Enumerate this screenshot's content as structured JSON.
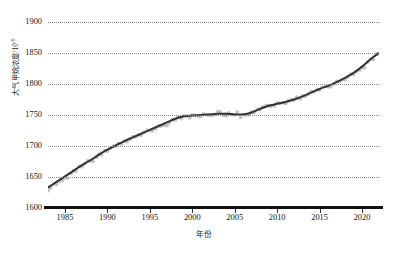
{
  "chart_data": {
    "type": "line",
    "title": "",
    "xlabel": "年份",
    "ylabel": "大气甲烷浓度/10",
    "ylabel_exponent": "-9",
    "xlim": [
      1983,
      2022
    ],
    "ylim": [
      1600,
      1900
    ],
    "yticks": [
      1600,
      1650,
      1700,
      1750,
      1800,
      1850,
      1900
    ],
    "xticks": [
      1985,
      1990,
      1995,
      2000,
      2005,
      2010,
      2015,
      2020
    ],
    "grid": true,
    "legend": "none",
    "series": [
      {
        "name": "大气甲烷浓度观测值",
        "style": "scatter",
        "color": "#b9b9b9",
        "x": [
          1983,
          1984,
          1985,
          1986,
          1987,
          1988,
          1989,
          1990,
          1991,
          1992,
          1993,
          1994,
          1995,
          1996,
          1997,
          1998,
          1999,
          2000,
          2001,
          2002,
          2003,
          2004,
          2005,
          2006,
          2007,
          2008,
          2009,
          2010,
          2011,
          2012,
          2013,
          2014,
          2015,
          2016,
          2017,
          2018,
          2019,
          2020,
          2021,
          2022
        ],
        "values": [
          1630,
          1639,
          1648,
          1658,
          1668,
          1676,
          1685,
          1694,
          1700,
          1707,
          1713,
          1719,
          1725,
          1731,
          1735,
          1743,
          1748,
          1748,
          1749,
          1750,
          1754,
          1751,
          1751,
          1750,
          1753,
          1760,
          1765,
          1768,
          1771,
          1775,
          1780,
          1786,
          1792,
          1796,
          1803,
          1809,
          1816,
          1826,
          1838,
          1850
        ],
        "marker": "circle",
        "marker_size": 3
      },
      {
        "name": "平滑趋势线",
        "style": "line",
        "color": "#333333",
        "x": [
          1983,
          1984,
          1985,
          1986,
          1987,
          1988,
          1989,
          1990,
          1991,
          1992,
          1993,
          1994,
          1995,
          1996,
          1997,
          1998,
          1999,
          2000,
          2001,
          2002,
          2003,
          2004,
          2005,
          2006,
          2007,
          2008,
          2009,
          2010,
          2011,
          2012,
          2013,
          2014,
          2015,
          2016,
          2017,
          2018,
          2019,
          2020,
          2021,
          2022
        ],
        "values": [
          1633,
          1642,
          1651,
          1660,
          1669,
          1677,
          1686,
          1694,
          1701,
          1708,
          1714,
          1720,
          1726,
          1732,
          1738,
          1744,
          1748,
          1749,
          1750,
          1751,
          1752,
          1752,
          1751,
          1751,
          1754,
          1760,
          1765,
          1768,
          1771,
          1775,
          1780,
          1786,
          1792,
          1797,
          1803,
          1810,
          1818,
          1828,
          1840,
          1850
        ],
        "linewidth": 2
      }
    ]
  }
}
